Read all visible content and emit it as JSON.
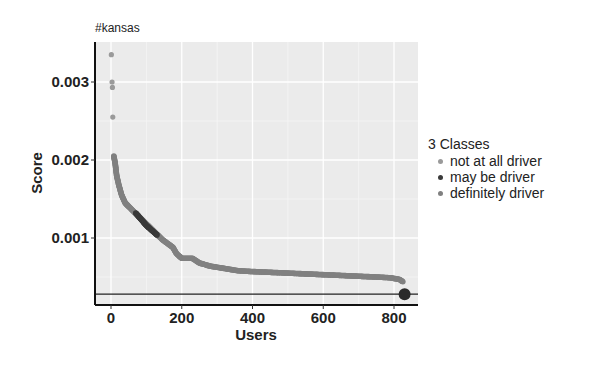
{
  "chart_data": {
    "type": "scatter",
    "title": "#kansas",
    "xlabel": "Users",
    "ylabel": "Score",
    "xlim": [
      -30,
      880
    ],
    "ylim": [
      0.00015,
      0.0035
    ],
    "x_ticks": [
      0,
      200,
      400,
      600,
      800
    ],
    "x_tick_labels": [
      "0",
      "200",
      "400",
      "600",
      "800"
    ],
    "y_ticks": [
      0.001,
      0.002,
      0.003
    ],
    "y_tick_labels": [
      "0.001",
      "0.002",
      "0.003"
    ],
    "grid": true,
    "legend_position": "right",
    "legend_title": "3 Classes",
    "hline": 0.00028,
    "series": [
      {
        "name": "not at all driver",
        "color": "#9a9a9a",
        "points": [
          [
            1,
            0.00335
          ],
          [
            3,
            0.003
          ],
          [
            4,
            0.00293
          ],
          [
            5,
            0.00255
          ]
        ]
      },
      {
        "name": "may be driver",
        "color": "#3a3a3a",
        "points": [
          [
            70,
            0.00132
          ],
          [
            85,
            0.00124
          ],
          [
            100,
            0.00116
          ],
          [
            115,
            0.0011
          ],
          [
            130,
            0.00104
          ]
        ]
      },
      {
        "name": "definitely driver",
        "color": "#808080",
        "points": [
          [
            8,
            0.00205
          ],
          [
            12,
            0.00195
          ],
          [
            16,
            0.0018
          ],
          [
            22,
            0.00168
          ],
          [
            30,
            0.00155
          ],
          [
            40,
            0.00145
          ],
          [
            55,
            0.00138
          ],
          [
            145,
            0.00098
          ],
          [
            160,
            0.00093
          ],
          [
            175,
            0.00088
          ],
          [
            185,
            0.0008
          ],
          [
            200,
            0.00074
          ],
          [
            230,
            0.00074
          ],
          [
            250,
            0.00068
          ],
          [
            280,
            0.00064
          ],
          [
            320,
            0.00061
          ],
          [
            360,
            0.00058
          ],
          [
            400,
            0.00057
          ],
          [
            450,
            0.00056
          ],
          [
            500,
            0.00055
          ],
          [
            550,
            0.00054
          ],
          [
            600,
            0.00053
          ],
          [
            650,
            0.00052
          ],
          [
            700,
            0.00051
          ],
          [
            750,
            0.0005
          ],
          [
            790,
            0.00049
          ],
          [
            815,
            0.00047
          ],
          [
            825,
            0.00044
          ]
        ]
      }
    ],
    "annotations": [
      {
        "type": "large-point",
        "x": 830,
        "y": 0.00028,
        "color": "#2a2a2a"
      }
    ]
  },
  "legend": {
    "title": "3 Classes",
    "items": [
      {
        "label": "not at all driver",
        "color": "#9a9a9a"
      },
      {
        "label": "may be driver",
        "color": "#3a3a3a"
      },
      {
        "label": "definitely driver",
        "color": "#808080"
      }
    ]
  }
}
